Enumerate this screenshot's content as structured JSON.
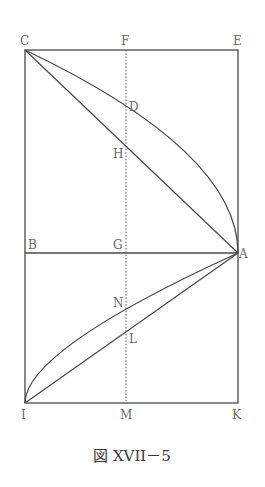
{
  "figure": {
    "caption": "図 XVII－5",
    "colors": {
      "line": "#4a4a4a",
      "label": "#6a6a6a",
      "background": "#ffffff"
    },
    "points": {
      "C": {
        "label": "C",
        "x": 25,
        "y": 50
      },
      "F": {
        "label": "F",
        "x": 126,
        "y": 50
      },
      "E": {
        "label": "E",
        "x": 238,
        "y": 50
      },
      "D": {
        "label": "D",
        "x": 126,
        "y": 106
      },
      "H": {
        "label": "H",
        "x": 126,
        "y": 147
      },
      "B": {
        "label": "B",
        "x": 25,
        "y": 253
      },
      "G": {
        "label": "G",
        "x": 126,
        "y": 253
      },
      "A": {
        "label": "A",
        "x": 238,
        "y": 253
      },
      "N": {
        "label": "N",
        "x": 126,
        "y": 310
      },
      "L": {
        "label": "L",
        "x": 126,
        "y": 332
      },
      "I": {
        "label": "I",
        "x": 25,
        "y": 403
      },
      "M": {
        "label": "M",
        "x": 126,
        "y": 403
      },
      "K": {
        "label": "K",
        "x": 238,
        "y": 403
      }
    },
    "segments": [
      {
        "name": "rectangle-CEKI",
        "type": "rect"
      },
      {
        "name": "line-BA",
        "from": "B",
        "to": "A"
      },
      {
        "name": "line-CA",
        "from": "C",
        "to": "A"
      },
      {
        "name": "line-IA",
        "from": "I",
        "to": "A"
      },
      {
        "name": "curve-CDA",
        "type": "parabola",
        "from": "C",
        "to": "A"
      },
      {
        "name": "curve-INA",
        "type": "parabola",
        "from": "I",
        "to": "A"
      },
      {
        "name": "dotted-FM",
        "type": "dotted",
        "from": "F",
        "to": "M"
      }
    ]
  }
}
